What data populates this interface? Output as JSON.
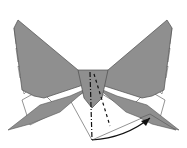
{
  "diagram": {
    "colors": {
      "paper_colored": "#8f8f8f",
      "paper_white": "#ffffff",
      "line": "#555555",
      "arrow": "#111111"
    },
    "annotations": {
      "valley_fold_line": "dashed",
      "mountain_fold_line": "dash-dot",
      "arrow": "curved fold arrow to the right wing tip"
    }
  }
}
